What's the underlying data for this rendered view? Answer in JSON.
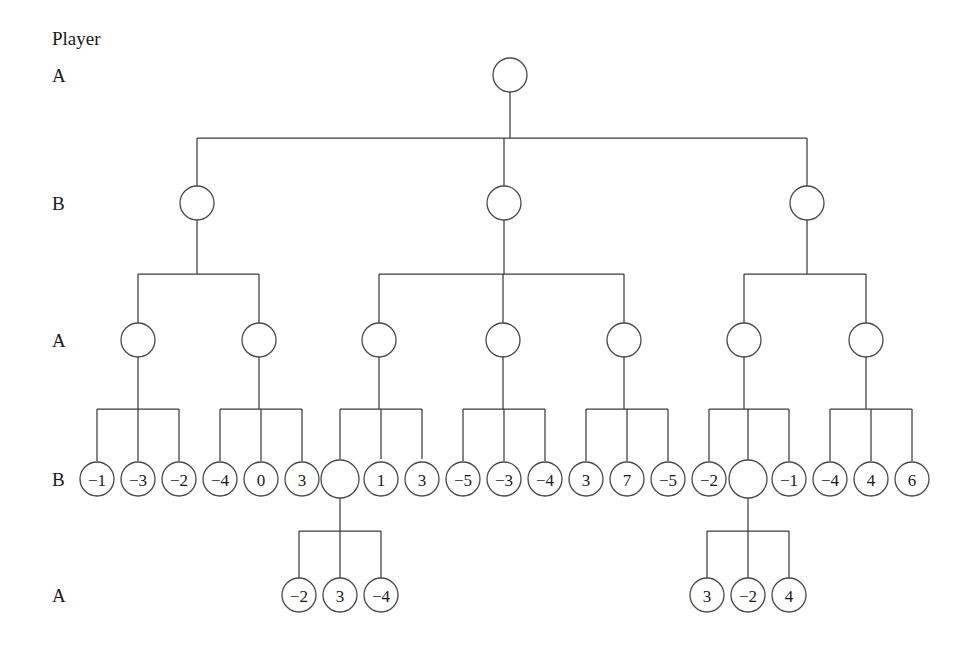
{
  "figure": {
    "header_label": "Player",
    "background_color": "#ffffff",
    "line_color": "#3c3c3c",
    "node_stroke_color": "#4a4a4a",
    "node_fill_color": "#ffffff",
    "text_color": "#1a1a1a"
  },
  "row_labels": [
    {
      "text": "A",
      "x": 52,
      "y": 75
    },
    {
      "text": "B",
      "x": 52,
      "y": 203
    },
    {
      "text": "A",
      "x": 52,
      "y": 340
    },
    {
      "text": "B",
      "x": 52,
      "y": 479
    },
    {
      "text": "A",
      "x": 52,
      "y": 595
    }
  ],
  "levels": [
    {
      "name": "level-0-player-a",
      "player": "A",
      "y": 75
    },
    {
      "name": "level-1-player-b",
      "player": "B",
      "y": 203
    },
    {
      "name": "level-2-player-a",
      "player": "A",
      "y": 340
    },
    {
      "name": "level-3-player-b",
      "player": "B",
      "y": 479
    },
    {
      "name": "level-4-player-a",
      "player": "A",
      "y": 595
    }
  ],
  "chart_data": {
    "type": "diagram",
    "tree": {
      "root_label": "",
      "leaf_payoffs_row_b": [
        -1,
        -3,
        -2,
        -4,
        0,
        3,
        null,
        1,
        3,
        -5,
        -3,
        -4,
        3,
        7,
        -5,
        -2,
        null,
        -1,
        -4,
        4,
        6
      ],
      "leaf_payoffs_row_a_left": [
        -2,
        3,
        -4
      ],
      "leaf_payoffs_row_a_right": [
        3,
        -2,
        4
      ],
      "branching": {
        "root_children": 3,
        "b_node_children": [
          2,
          3,
          2
        ],
        "a_node_children": [
          3,
          3,
          3,
          3,
          3,
          3,
          3
        ],
        "deep_subtree_children": [
          3,
          3
        ]
      }
    }
  },
  "nodes": [
    {
      "id": "n0",
      "label": "",
      "x": 510,
      "y": 75,
      "r": 17,
      "level": 0
    },
    {
      "id": "b1",
      "label": "",
      "x": 197,
      "y": 203,
      "r": 17,
      "level": 1
    },
    {
      "id": "b2",
      "label": "",
      "x": 504,
      "y": 203,
      "r": 17,
      "level": 1
    },
    {
      "id": "b3",
      "label": "",
      "x": 807,
      "y": 203,
      "r": 17,
      "level": 1
    },
    {
      "id": "a1",
      "label": "",
      "x": 138,
      "y": 340,
      "r": 17,
      "level": 2
    },
    {
      "id": "a2",
      "label": "",
      "x": 259,
      "y": 340,
      "r": 17,
      "level": 2
    },
    {
      "id": "a3",
      "label": "",
      "x": 379,
      "y": 340,
      "r": 17,
      "level": 2
    },
    {
      "id": "a4",
      "label": "",
      "x": 503,
      "y": 340,
      "r": 17,
      "level": 2
    },
    {
      "id": "a5",
      "label": "",
      "x": 624,
      "y": 340,
      "r": 17,
      "level": 2
    },
    {
      "id": "a6",
      "label": "",
      "x": 744,
      "y": 340,
      "r": 17,
      "level": 2
    },
    {
      "id": "a7",
      "label": "",
      "x": 866,
      "y": 340,
      "r": 17,
      "level": 2
    },
    {
      "id": "L1",
      "label": "−1",
      "x": 97,
      "y": 479,
      "r": 17,
      "level": 3
    },
    {
      "id": "L2",
      "label": "−3",
      "x": 138,
      "y": 479,
      "r": 17,
      "level": 3
    },
    {
      "id": "L3",
      "label": "−2",
      "x": 179,
      "y": 479,
      "r": 17,
      "level": 3
    },
    {
      "id": "L4",
      "label": "−4",
      "x": 220,
      "y": 479,
      "r": 17,
      "level": 3
    },
    {
      "id": "L5",
      "label": "0",
      "x": 261,
      "y": 479,
      "r": 17,
      "level": 3
    },
    {
      "id": "L6",
      "label": "3",
      "x": 302,
      "y": 479,
      "r": 17,
      "level": 3
    },
    {
      "id": "L7",
      "label": "",
      "x": 340,
      "y": 479,
      "r": 19,
      "level": 3
    },
    {
      "id": "L8",
      "label": "1",
      "x": 381,
      "y": 479,
      "r": 17,
      "level": 3
    },
    {
      "id": "L9",
      "label": "3",
      "x": 422,
      "y": 479,
      "r": 17,
      "level": 3
    },
    {
      "id": "L10",
      "label": "−5",
      "x": 463,
      "y": 479,
      "r": 17,
      "level": 3
    },
    {
      "id": "L11",
      "label": "−3",
      "x": 504,
      "y": 479,
      "r": 17,
      "level": 3
    },
    {
      "id": "L12",
      "label": "−4",
      "x": 545,
      "y": 479,
      "r": 17,
      "level": 3
    },
    {
      "id": "L13",
      "label": "3",
      "x": 586,
      "y": 479,
      "r": 17,
      "level": 3
    },
    {
      "id": "L14",
      "label": "7",
      "x": 627,
      "y": 479,
      "r": 17,
      "level": 3
    },
    {
      "id": "L15",
      "label": "−5",
      "x": 668,
      "y": 479,
      "r": 17,
      "level": 3
    },
    {
      "id": "L16",
      "label": "−2",
      "x": 709,
      "y": 479,
      "r": 17,
      "level": 3
    },
    {
      "id": "L17",
      "label": "",
      "x": 748,
      "y": 479,
      "r": 19,
      "level": 3
    },
    {
      "id": "L18",
      "label": "−1",
      "x": 789,
      "y": 479,
      "r": 17,
      "level": 3
    },
    {
      "id": "L19",
      "label": "−4",
      "x": 830,
      "y": 479,
      "r": 17,
      "level": 3
    },
    {
      "id": "L20",
      "label": "4",
      "x": 871,
      "y": 479,
      "r": 17,
      "level": 3
    },
    {
      "id": "L21",
      "label": "6",
      "x": 912,
      "y": 479,
      "r": 17,
      "level": 3
    },
    {
      "id": "D1",
      "label": "−2",
      "x": 299,
      "y": 595,
      "r": 17,
      "level": 4
    },
    {
      "id": "D2",
      "label": "3",
      "x": 340,
      "y": 595,
      "r": 17,
      "level": 4
    },
    {
      "id": "D3",
      "label": "−4",
      "x": 381,
      "y": 595,
      "r": 17,
      "level": 4
    },
    {
      "id": "D4",
      "label": "3",
      "x": 707,
      "y": 595,
      "r": 17,
      "level": 4
    },
    {
      "id": "D5",
      "label": "−2",
      "x": 748,
      "y": 595,
      "r": 17,
      "level": 4
    },
    {
      "id": "D6",
      "label": "4",
      "x": 789,
      "y": 595,
      "r": 17,
      "level": 4
    }
  ],
  "edge_groups": [
    {
      "name": "root-to-level-1",
      "parent_x": 510,
      "parent_bottom": 92,
      "bus_y": 138,
      "child_top": 186,
      "children_x": [
        197,
        504,
        807
      ]
    },
    {
      "name": "b1-to-level-2",
      "parent_x": 197,
      "parent_bottom": 220,
      "bus_y": 274,
      "child_top": 323,
      "children_x": [
        138,
        259
      ]
    },
    {
      "name": "b2-to-level-2",
      "parent_x": 504,
      "parent_bottom": 220,
      "bus_y": 274,
      "child_top": 323,
      "children_x": [
        379,
        503,
        624
      ]
    },
    {
      "name": "b3-to-level-2",
      "parent_x": 807,
      "parent_bottom": 220,
      "bus_y": 274,
      "child_top": 323,
      "children_x": [
        744,
        866
      ]
    },
    {
      "name": "a1-to-leaves",
      "parent_x": 138,
      "parent_bottom": 357,
      "bus_y": 409,
      "child_top": 461,
      "children_x": [
        97,
        138,
        179
      ]
    },
    {
      "name": "a2-to-leaves",
      "parent_x": 259,
      "parent_bottom": 357,
      "bus_y": 409,
      "child_top": 461,
      "children_x": [
        220,
        261,
        302
      ]
    },
    {
      "name": "a3-to-leaves",
      "parent_x": 379,
      "parent_bottom": 357,
      "bus_y": 409,
      "child_top": 459,
      "children_x": [
        340,
        381,
        422
      ]
    },
    {
      "name": "a4-to-leaves",
      "parent_x": 503,
      "parent_bottom": 357,
      "bus_y": 409,
      "child_top": 461,
      "children_x": [
        463,
        504,
        545
      ]
    },
    {
      "name": "a5-to-leaves",
      "parent_x": 624,
      "parent_bottom": 357,
      "bus_y": 409,
      "child_top": 461,
      "children_x": [
        586,
        627,
        668
      ]
    },
    {
      "name": "a6-to-leaves",
      "parent_x": 744,
      "parent_bottom": 357,
      "bus_y": 409,
      "child_top": 461,
      "children_x": [
        709,
        748,
        789
      ]
    },
    {
      "name": "a7-to-leaves",
      "parent_x": 866,
      "parent_bottom": 357,
      "bus_y": 409,
      "child_top": 461,
      "children_x": [
        830,
        871,
        912
      ]
    },
    {
      "name": "l7-to-deep",
      "parent_x": 340,
      "parent_bottom": 498,
      "bus_y": 531,
      "child_top": 578,
      "children_x": [
        299,
        340,
        381
      ]
    },
    {
      "name": "l17-to-deep",
      "parent_x": 748,
      "parent_bottom": 498,
      "bus_y": 531,
      "child_top": 578,
      "children_x": [
        707,
        748,
        789
      ]
    }
  ],
  "header": {
    "x": 52,
    "y": 38
  }
}
